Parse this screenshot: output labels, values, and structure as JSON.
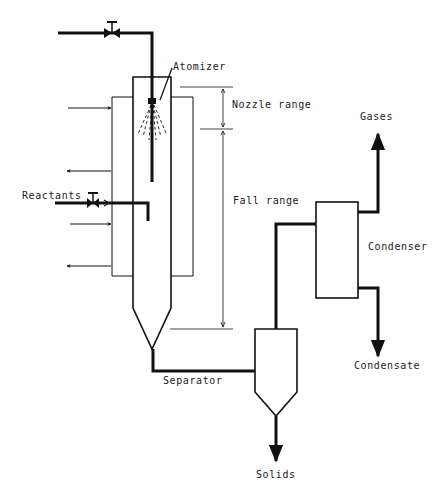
{
  "diagram": {
    "type": "process-flow",
    "labels": {
      "atomizer": "Atomizer",
      "nozzle_range": "Nozzle range",
      "fall_range": "Fall range",
      "reactants": "Reactants",
      "separator": "Separator",
      "solids": "Solids",
      "gases": "Gases",
      "condenser": "Condenser",
      "condensate": "Condensate"
    },
    "colors": {
      "line": "#111111",
      "background": "#ffffff",
      "text": "#222222"
    }
  }
}
